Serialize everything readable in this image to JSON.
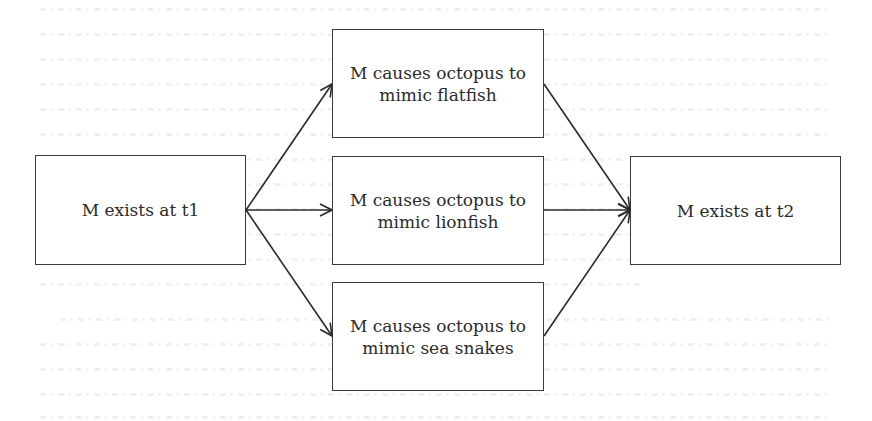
{
  "diagram": {
    "type": "flowchart",
    "nodes": [
      {
        "id": "t1",
        "label": "M exists at t1",
        "lines": [
          "M exists at t1"
        ]
      },
      {
        "id": "flatfish",
        "label": "M causes octopus to mimic flatfish",
        "lines": [
          "M causes octopus to",
          "mimic flatfish"
        ]
      },
      {
        "id": "lionfish",
        "label": "M causes octopus to mimic lionfish",
        "lines": [
          "M causes octopus to",
          "mimic lionfish"
        ]
      },
      {
        "id": "seasnakes",
        "label": "M causes octopus to mimic sea snakes",
        "lines": [
          "M causes octopus to",
          "mimic sea snakes"
        ]
      },
      {
        "id": "t2",
        "label": "M exists at t2",
        "lines": [
          "M exists at t2"
        ]
      }
    ],
    "edges": [
      {
        "from": "t1",
        "to": "flatfish"
      },
      {
        "from": "t1",
        "to": "lionfish"
      },
      {
        "from": "t1",
        "to": "seasnakes"
      },
      {
        "from": "flatfish",
        "to": "t2"
      },
      {
        "from": "lionfish",
        "to": "t2"
      },
      {
        "from": "seasnakes",
        "to": "t2"
      }
    ],
    "colors": {
      "stroke": "#2a2a2a",
      "background": "#ffffff",
      "text": "#2b2b2b"
    }
  }
}
